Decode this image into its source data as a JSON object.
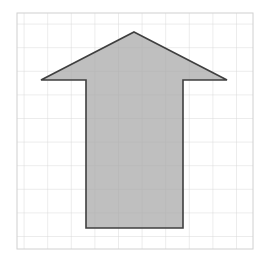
{
  "figure": {
    "name": "up-arrow-on-grid",
    "background_color": "#ffffff",
    "canvas": {
      "width": 262,
      "height": 268
    }
  },
  "grid": {
    "name": "square-grid",
    "columns": 10,
    "rows": 10,
    "cell_size": 23.6,
    "origin_x": 17,
    "origin_y": 13,
    "width": 236,
    "height": 236,
    "line_color": "#d9d9d9",
    "border_color": "#d0d0d0",
    "line_width": 1
  },
  "shape": {
    "name": "up-arrow",
    "type": "polygon",
    "fill_color": "#a9a9a9",
    "fill_opacity": 0.75,
    "stroke_color": "#3f3f3f",
    "stroke_width": 1.6,
    "points": "134,32 227,80 183,80 183,228 86,228 86,80 41,80",
    "vertices": [
      {
        "label": "tip",
        "x": 134,
        "y": 32
      },
      {
        "label": "right-barb",
        "x": 227,
        "y": 80
      },
      {
        "label": "right-shoulder",
        "x": 183,
        "y": 80
      },
      {
        "label": "right-shaft-bottom",
        "x": 183,
        "y": 228
      },
      {
        "label": "left-shaft-bottom",
        "x": 86,
        "y": 228
      },
      {
        "label": "left-shoulder",
        "x": 86,
        "y": 80
      },
      {
        "label": "left-barb",
        "x": 41,
        "y": 80
      }
    ],
    "shaft": {
      "left": 86,
      "right": 183,
      "top": 80,
      "bottom": 228,
      "width_cells": 4,
      "height_cells": 6
    },
    "head": {
      "tip_x": 134,
      "tip_y": 32,
      "left_x": 41,
      "right_x": 227,
      "base_y": 80,
      "width_cells": 8,
      "height_cells": 2
    }
  }
}
